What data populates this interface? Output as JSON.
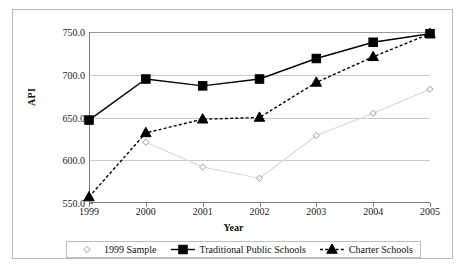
{
  "chart_data": {
    "type": "line",
    "title": "",
    "xlabel": "Year",
    "ylabel": "API",
    "categories": [
      "1999",
      "2000",
      "2001",
      "2002",
      "2003",
      "2004",
      "2005"
    ],
    "x": [
      1999,
      2000,
      2001,
      2002,
      2003,
      2004,
      2005
    ],
    "ylim": [
      550,
      750
    ],
    "yticks": [
      550,
      600,
      650,
      700,
      750
    ],
    "ytick_labels": [
      "550.0",
      "600.0",
      "650.0",
      "700.0",
      "750.0"
    ],
    "grid": "horizontal",
    "legend_position": "bottom",
    "series": [
      {
        "name": "1999 Sample",
        "marker": "open-diamond",
        "line_style": "solid",
        "color": "#d6d6d6",
        "marker_color": "#ffffff",
        "marker_edge": "#9a9a9a",
        "values": [
          null,
          621,
          592,
          579,
          629,
          655,
          683
        ]
      },
      {
        "name": "Traditional Public Schools",
        "marker": "filled-square",
        "line_style": "solid",
        "color": "#000000",
        "marker_color": "#000000",
        "marker_edge": "#000000",
        "values": [
          647,
          695,
          687,
          695,
          719,
          738,
          748
        ]
      },
      {
        "name": "Charter Schools",
        "marker": "filled-triangle",
        "line_style": "dashed",
        "color": "#000000",
        "marker_color": "#000000",
        "marker_edge": "#000000",
        "values": [
          557,
          632,
          648,
          650,
          691,
          721,
          748
        ]
      }
    ]
  },
  "axes": {
    "y_title": "API",
    "x_title": "Year",
    "y_tick_labels": [
      "750.0",
      "700.0",
      "650.0",
      "600.0",
      "550.0"
    ],
    "x_tick_labels": [
      "1999",
      "2000",
      "2001",
      "2002",
      "2003",
      "2004",
      "2005"
    ]
  },
  "legend": {
    "entries": [
      {
        "label": "1999 Sample"
      },
      {
        "label": "Traditional Public Schools"
      },
      {
        "label": "Charter Schools"
      }
    ]
  }
}
